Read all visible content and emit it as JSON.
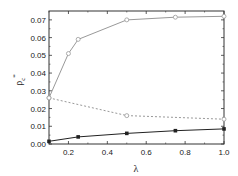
{
  "chart_data": {
    "type": "line",
    "title": "",
    "xlabel": "λ",
    "ylabel": "ρc*",
    "xlim": [
      0.1,
      1.0
    ],
    "ylim": [
      0.0,
      0.075
    ],
    "grid": false,
    "legend": null,
    "x_ticks": [
      "0.2",
      "0.4",
      "0.6",
      "0.8",
      "1.0"
    ],
    "y_ticks": [
      "0.00",
      "0.01",
      "0.02",
      "0.03",
      "0.04",
      "0.05",
      "0.06",
      "0.07"
    ],
    "series": [
      {
        "name": "upper (open circles, solid)",
        "marker": "open-circle",
        "line": "solid",
        "color": "#999999",
        "x": [
          0.1,
          0.2,
          0.25,
          0.5,
          0.75,
          1.0
        ],
        "y": [
          0.026,
          0.051,
          0.059,
          0.07,
          0.0715,
          0.072
        ]
      },
      {
        "name": "middle (open circles, dashed)",
        "marker": "open-circle",
        "line": "dashed",
        "color": "#999999",
        "x": [
          0.1,
          0.5,
          1.0
        ],
        "y": [
          0.026,
          0.016,
          0.014
        ]
      },
      {
        "name": "lower (filled squares, solid)",
        "marker": "filled-square",
        "line": "solid",
        "color": "#222222",
        "x": [
          0.1,
          0.25,
          0.5,
          0.75,
          1.0
        ],
        "y": [
          0.0015,
          0.004,
          0.006,
          0.0075,
          0.0085
        ]
      }
    ]
  }
}
